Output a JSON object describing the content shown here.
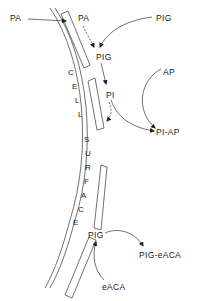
{
  "diagram": {
    "title": "",
    "membrane_label": [
      "C",
      "E",
      "L",
      "L",
      "S",
      "U",
      "R",
      "F",
      "A",
      "C",
      "E"
    ],
    "nodes": {
      "pa_outside": "PA",
      "pa_inside": "PA",
      "pig_source": "PIG",
      "pig_membrane": "PIG",
      "ap": "AP",
      "pi": "PI",
      "pi_ap": "PI-AP",
      "pig_lower": "PIG",
      "pig_eaca": "PIG-eACA",
      "eaca": "eACA"
    },
    "edges": [
      {
        "from": "PA",
        "to": "PA (membrane)",
        "style": "solid"
      },
      {
        "from": "PA (membrane)",
        "to": "PIG",
        "style": "dashed"
      },
      {
        "from": "PIG (source)",
        "to": "PIG",
        "style": "solid"
      },
      {
        "from": "PIG",
        "to": "PI",
        "style": "solid"
      },
      {
        "from": "PI",
        "to": "membrane",
        "style": "dashed"
      },
      {
        "from": "PI",
        "to": "PI-AP",
        "style": "solid"
      },
      {
        "from": "AP",
        "to": "PI-AP",
        "style": "solid"
      },
      {
        "from": "eACA",
        "to": "PIG",
        "style": "solid"
      },
      {
        "from": "PIG",
        "to": "PIG-eACA",
        "style": "solid"
      }
    ]
  }
}
